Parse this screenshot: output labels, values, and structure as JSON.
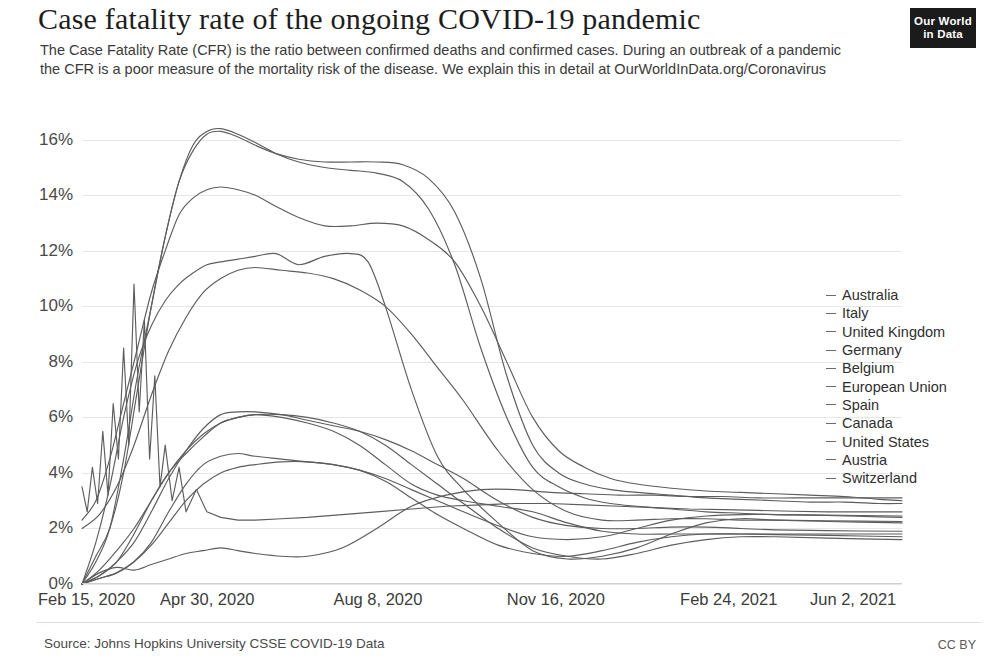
{
  "header": {
    "title": "Case fatality rate of the ongoing COVID-19 pandemic",
    "subtitle": "The Case Fatality Rate (CFR) is the ratio between confirmed deaths and confirmed cases. During an outbreak of a pandemic the CFR is a poor measure of the mortality risk of the disease. We explain this in detail at OurWorldInData.org/Coronavirus",
    "logo_line1": "Our World",
    "logo_line2": "in Data"
  },
  "footer": {
    "source": "Source: Johns Hopkins University CSSE COVID-19 Data",
    "license": "CC BY"
  },
  "chart_data": {
    "type": "line",
    "title": "Case fatality rate of the ongoing COVID-19 pandemic",
    "xlabel": "",
    "ylabel": "",
    "ylim": [
      0,
      17
    ],
    "ytick_labels": [
      "0%",
      "2%",
      "4%",
      "6%",
      "8%",
      "10%",
      "12%",
      "14%",
      "16%"
    ],
    "ytick_values": [
      0,
      2,
      4,
      6,
      8,
      10,
      12,
      14,
      16
    ],
    "xtick_labels": [
      "Feb 15, 2020",
      "Apr 30, 2020",
      "Aug 8, 2020",
      "Nov 16, 2020",
      "Feb 24, 2021",
      "Jun 2, 2021"
    ],
    "xtick_values": [
      0,
      75,
      175,
      275,
      375,
      473
    ],
    "x_unit": "days since Feb 15, 2020",
    "x_range": [
      0,
      473
    ],
    "grid": true,
    "legend_position": "right",
    "series": [
      {
        "name": "Australia",
        "end_value": 3.1,
        "x": [
          0,
          10,
          20,
          30,
          40,
          50,
          60,
          70,
          80,
          90,
          100,
          115,
          130,
          150,
          170,
          190,
          210,
          230,
          250,
          270,
          290,
          310,
          330,
          350,
          370,
          390,
          410,
          430,
          450,
          473
        ],
        "values": [
          0,
          0.4,
          0.6,
          0.5,
          0.7,
          0.9,
          1.1,
          1.2,
          1.3,
          1.2,
          1.1,
          1.0,
          1.0,
          1.3,
          2.0,
          2.8,
          3.2,
          3.4,
          3.4,
          3.3,
          3.25,
          3.2,
          3.2,
          3.15,
          3.15,
          3.1,
          3.1,
          3.1,
          3.1,
          3.1
        ]
      },
      {
        "name": "Italy",
        "end_value": 3.0,
        "x": [
          0,
          8,
          16,
          24,
          32,
          40,
          48,
          56,
          64,
          72,
          80,
          90,
          100,
          112,
          125,
          140,
          155,
          170,
          185,
          200,
          215,
          230,
          245,
          260,
          275,
          290,
          305,
          320,
          340,
          360,
          380,
          400,
          420,
          440,
          460,
          473
        ],
        "values": [
          2.3,
          3.0,
          4.5,
          6.5,
          8.5,
          10.5,
          12.0,
          13.3,
          13.9,
          14.2,
          14.3,
          14.2,
          14.0,
          13.6,
          13.2,
          12.9,
          12.9,
          13.0,
          12.9,
          12.4,
          11.6,
          10.0,
          8.0,
          6.0,
          4.8,
          4.2,
          3.8,
          3.6,
          3.45,
          3.35,
          3.3,
          3.25,
          3.2,
          3.15,
          3.05,
          3.0
        ]
      },
      {
        "name": "United Kingdom",
        "end_value": 2.9,
        "x": [
          0,
          8,
          16,
          24,
          32,
          40,
          48,
          56,
          64,
          72,
          80,
          90,
          100,
          112,
          125,
          140,
          155,
          170,
          185,
          200,
          215,
          230,
          245,
          260,
          275,
          290,
          305,
          320,
          340,
          360,
          380,
          400,
          420,
          440,
          460,
          473
        ],
        "values": [
          0,
          1.0,
          2.0,
          4.0,
          7.0,
          10.0,
          12.5,
          14.5,
          15.6,
          16.2,
          16.3,
          16.1,
          15.8,
          15.5,
          15.3,
          15.2,
          15.2,
          15.2,
          15.1,
          14.6,
          13.4,
          11.0,
          7.5,
          5.0,
          4.0,
          3.6,
          3.4,
          3.3,
          3.2,
          3.1,
          3.05,
          3.0,
          2.95,
          2.95,
          2.9,
          2.9
        ]
      },
      {
        "name": "Germany",
        "end_value": 2.45,
        "x": [
          0,
          10,
          20,
          30,
          40,
          50,
          60,
          70,
          80,
          90,
          100,
          115,
          130,
          145,
          160,
          175,
          190,
          205,
          220,
          240,
          260,
          280,
          300,
          320,
          340,
          360,
          380,
          400,
          430,
          473
        ],
        "values": [
          0,
          0.2,
          0.4,
          0.8,
          1.5,
          2.6,
          3.6,
          4.3,
          4.6,
          4.7,
          4.6,
          4.5,
          4.4,
          4.3,
          4.1,
          3.8,
          3.4,
          3.0,
          2.6,
          2.1,
          1.7,
          1.6,
          1.7,
          2.0,
          2.3,
          2.45,
          2.5,
          2.5,
          2.48,
          2.45
        ]
      },
      {
        "name": "Belgium",
        "end_value": 2.4,
        "x": [
          0,
          8,
          16,
          24,
          32,
          40,
          48,
          56,
          64,
          72,
          80,
          90,
          100,
          112,
          125,
          140,
          155,
          170,
          185,
          200,
          215,
          230,
          245,
          260,
          275,
          290,
          305,
          320,
          340,
          360,
          380,
          400,
          420,
          440,
          460,
          473
        ],
        "values": [
          0,
          0.8,
          2.0,
          4.5,
          7.5,
          10.0,
          12.5,
          14.5,
          15.8,
          16.3,
          16.4,
          16.2,
          15.9,
          15.5,
          15.2,
          15.0,
          14.9,
          14.8,
          14.5,
          13.5,
          11.5,
          8.5,
          6.0,
          4.2,
          3.5,
          3.1,
          2.9,
          2.8,
          2.7,
          2.6,
          2.55,
          2.5,
          2.48,
          2.45,
          2.42,
          2.4
        ]
      },
      {
        "name": "European Union",
        "end_value": 2.25,
        "x": [
          0,
          10,
          20,
          30,
          40,
          50,
          60,
          70,
          80,
          90,
          100,
          115,
          130,
          145,
          160,
          175,
          190,
          205,
          220,
          240,
          260,
          280,
          300,
          320,
          340,
          360,
          380,
          400,
          430,
          473
        ],
        "values": [
          2.0,
          2.5,
          3.5,
          5.0,
          6.8,
          8.4,
          9.6,
          10.5,
          11.0,
          11.3,
          11.4,
          11.3,
          11.2,
          11.0,
          10.6,
          10.0,
          9.0,
          7.8,
          6.6,
          4.8,
          3.4,
          2.6,
          2.3,
          2.3,
          2.35,
          2.35,
          2.3,
          2.3,
          2.28,
          2.25
        ]
      },
      {
        "name": "Spain",
        "end_value": 2.2,
        "x": [
          0,
          8,
          16,
          24,
          32,
          40,
          48,
          56,
          64,
          72,
          80,
          90,
          100,
          112,
          125,
          140,
          155,
          165,
          175,
          190,
          205,
          220,
          240,
          260,
          280,
          300,
          320,
          340,
          360,
          380,
          400,
          430,
          473
        ],
        "values": [
          0,
          1.5,
          3.5,
          6.0,
          8.0,
          9.3,
          10.2,
          10.8,
          11.2,
          11.5,
          11.6,
          11.7,
          11.8,
          11.9,
          11.5,
          11.8,
          11.9,
          11.6,
          10.0,
          7.0,
          4.6,
          3.4,
          2.2,
          1.2,
          0.9,
          1.0,
          1.3,
          1.8,
          2.2,
          2.35,
          2.3,
          2.25,
          2.2
        ]
      },
      {
        "name": "Canada",
        "end_value": 1.9,
        "x": [
          0,
          10,
          20,
          30,
          40,
          50,
          60,
          70,
          80,
          90,
          100,
          115,
          130,
          145,
          160,
          175,
          190,
          205,
          220,
          240,
          260,
          280,
          300,
          320,
          340,
          360,
          380,
          400,
          430,
          473
        ],
        "values": [
          0,
          0.3,
          0.8,
          1.5,
          2.6,
          3.8,
          4.8,
          5.6,
          6.1,
          6.2,
          6.2,
          6.1,
          5.9,
          5.7,
          5.5,
          5.2,
          4.8,
          4.3,
          3.8,
          3.0,
          2.4,
          2.1,
          2.0,
          2.0,
          2.05,
          2.05,
          2.0,
          1.95,
          1.92,
          1.9
        ]
      },
      {
        "name": "United States",
        "end_value": 1.8,
        "x": [
          0,
          10,
          20,
          30,
          40,
          50,
          60,
          70,
          80,
          90,
          100,
          115,
          130,
          145,
          160,
          175,
          190,
          205,
          220,
          240,
          260,
          280,
          300,
          320,
          340,
          360,
          380,
          400,
          430,
          473
        ],
        "values": [
          0,
          0.5,
          1.2,
          2.0,
          3.0,
          4.0,
          4.7,
          5.3,
          5.8,
          6.0,
          6.1,
          6.0,
          5.8,
          5.5,
          5.0,
          4.3,
          3.6,
          3.2,
          3.0,
          2.8,
          2.6,
          2.2,
          1.9,
          1.8,
          1.8,
          1.8,
          1.8,
          1.8,
          1.8,
          1.8
        ]
      },
      {
        "name": "Austria",
        "end_value": 1.7,
        "x": [
          0,
          10,
          20,
          30,
          40,
          50,
          60,
          70,
          80,
          90,
          100,
          115,
          130,
          145,
          160,
          175,
          190,
          205,
          220,
          240,
          260,
          280,
          300,
          320,
          340,
          360,
          380,
          400,
          430,
          473
        ],
        "values": [
          0,
          0.2,
          0.4,
          0.8,
          1.4,
          2.2,
          3.0,
          3.6,
          4.0,
          4.2,
          4.3,
          4.4,
          4.4,
          4.3,
          4.1,
          3.7,
          3.1,
          2.5,
          2.0,
          1.4,
          1.1,
          1.0,
          1.2,
          1.5,
          1.7,
          1.8,
          1.8,
          1.78,
          1.75,
          1.7
        ]
      },
      {
        "name": "Switzerland",
        "end_value": 1.6,
        "x": [
          0,
          10,
          20,
          30,
          40,
          50,
          60,
          70,
          80,
          90,
          100,
          115,
          130,
          145,
          160,
          175,
          190,
          205,
          220,
          240,
          260,
          280,
          300,
          320,
          340,
          360,
          380,
          400,
          430,
          473
        ],
        "values": [
          0,
          0.3,
          0.8,
          1.8,
          3.0,
          4.0,
          4.8,
          5.4,
          5.8,
          6.0,
          6.1,
          6.1,
          6.0,
          5.8,
          5.5,
          5.0,
          4.3,
          3.6,
          2.9,
          2.0,
          1.3,
          1.0,
          0.9,
          1.1,
          1.4,
          1.6,
          1.7,
          1.7,
          1.65,
          1.6
        ]
      },
      {
        "name": "noisy-early-series",
        "end_value": 2.6,
        "x": [
          0,
          3,
          6,
          9,
          12,
          15,
          18,
          21,
          24,
          27,
          30,
          33,
          36,
          39,
          42,
          45,
          48,
          52,
          56,
          60,
          66,
          72,
          80,
          90,
          100,
          115,
          130,
          150,
          170,
          190,
          210,
          230,
          250,
          270,
          290,
          310,
          330,
          350,
          370,
          390,
          410,
          430,
          450,
          473
        ],
        "values": [
          3.5,
          2.6,
          4.2,
          2.9,
          5.5,
          3.2,
          6.5,
          4.5,
          8.5,
          5.0,
          10.8,
          6.2,
          9.5,
          4.5,
          7.5,
          3.5,
          5.0,
          3.0,
          4.2,
          2.6,
          3.4,
          2.6,
          2.4,
          2.3,
          2.3,
          2.35,
          2.4,
          2.5,
          2.6,
          2.7,
          2.8,
          2.85,
          2.9,
          2.9,
          2.85,
          2.8,
          2.75,
          2.7,
          2.68,
          2.65,
          2.62,
          2.6,
          2.6,
          2.6
        ]
      }
    ]
  }
}
